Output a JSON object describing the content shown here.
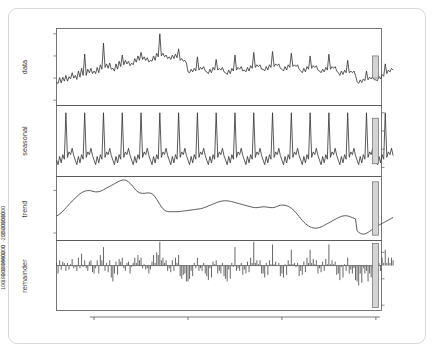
{
  "chart_data": {
    "type": "line",
    "title": "",
    "subtitle": "",
    "xlabel": "time",
    "ylabel": "",
    "grid": false,
    "legend": null,
    "x_ticks": [
      "1970",
      "1975",
      "1980",
      "1985"
    ],
    "x_tick_values": [
      1970,
      1975,
      1980,
      1985
    ],
    "xlim": [
      1968.0,
      1985.3
    ],
    "panels": [
      {
        "name": "data",
        "label": "data",
        "type": "line",
        "axis_side": "left",
        "ylim": [
          880,
          2620
        ],
        "y_ticks": [
          "1000",
          "1500",
          "2000",
          "2500"
        ],
        "y_tick_values": [
          1000,
          1500,
          2000,
          2500
        ],
        "bar_units": 500,
        "values": [
          1400,
          1380,
          1510,
          1390,
          1520,
          1430,
          1560,
          1430,
          1530,
          1480,
          1620,
          1500,
          1560,
          1470,
          1660,
          1520,
          1720,
          1560,
          2040,
          1560,
          1700,
          1620,
          1720,
          1600,
          1660,
          1600,
          1740,
          1620,
          1800,
          1700,
          2290,
          1740,
          1820,
          1720,
          1840,
          1700,
          1720,
          1660,
          1820,
          1700,
          1880,
          1760,
          2020,
          1800,
          1900,
          1820,
          1880,
          1780,
          1840,
          1800,
          1940,
          1860,
          2000,
          1900,
          2080,
          1920,
          1980,
          1900,
          1960,
          1860,
          1900,
          1880,
          2000,
          1900,
          2060,
          1980,
          2500,
          2000,
          2060,
          1980,
          2020,
          1940,
          1980,
          1920,
          2020,
          1940,
          2040,
          1960,
          2160,
          1900,
          1940,
          1880,
          1900,
          1840,
          1640,
          1620,
          1700,
          1640,
          1720,
          1660,
          1980,
          1680,
          1740,
          1700,
          1760,
          1660,
          1640,
          1600,
          1700,
          1620,
          1740,
          1680,
          1920,
          1680,
          1720,
          1680,
          1740,
          1640,
          1620,
          1580,
          1680,
          1600,
          1720,
          1660,
          2020,
          1680,
          1740,
          1700,
          1760,
          1660,
          1680,
          1640,
          1740,
          1660,
          1780,
          1720,
          2080,
          1740,
          1800,
          1760,
          1800,
          1700,
          1700,
          1660,
          1760,
          1680,
          1800,
          1740,
          2100,
          1760,
          1820,
          1780,
          1820,
          1720,
          1700,
          1660,
          1760,
          1680,
          1800,
          1740,
          2060,
          1760,
          1800,
          1760,
          1800,
          1700,
          1660,
          1620,
          1720,
          1640,
          1760,
          1700,
          2000,
          1720,
          1780,
          1740,
          1780,
          1680,
          1660,
          1620,
          1700,
          1640,
          1740,
          1680,
          2040,
          1700,
          1760,
          1720,
          1760,
          1660,
          1620,
          1560,
          1660,
          1580,
          1680,
          1620,
          1900,
          1620,
          1660,
          1620,
          1660,
          1560,
          1420,
          1380,
          1460,
          1400,
          1480,
          1440,
          1660,
          1460,
          1520,
          1480,
          1540,
          1460,
          1460,
          1440,
          1540,
          1480,
          1580,
          1540,
          1820,
          1600,
          1680,
          1640,
          1720,
          1680
        ]
      },
      {
        "name": "seasonal",
        "label": "seasonal",
        "type": "line",
        "axis_side": "right",
        "ylim": [
          -300,
          480
        ],
        "y_ticks": [
          "-200",
          "0",
          "200",
          "400"
        ],
        "y_tick_values": [
          -200,
          0,
          200,
          400
        ],
        "bar_units": 500,
        "pattern": [
          -120,
          -170,
          -80,
          -150,
          -60,
          -110,
          400,
          -90,
          -30,
          -60,
          10,
          -70
        ]
      },
      {
        "name": "trend",
        "label": "trend",
        "type": "line",
        "axis_side": "left",
        "ylim": [
          1330,
          1930
        ],
        "y_ticks": [
          "1400",
          "1800"
        ],
        "y_tick_values": [
          1400,
          1800
        ],
        "bar_units": 500,
        "values": [
          1560,
          1568,
          1578,
          1590,
          1604,
          1620,
          1636,
          1652,
          1668,
          1684,
          1700,
          1714,
          1728,
          1742,
          1756,
          1768,
          1778,
          1786,
          1792,
          1796,
          1798,
          1798,
          1796,
          1792,
          1788,
          1786,
          1786,
          1788,
          1792,
          1798,
          1806,
          1814,
          1822,
          1830,
          1838,
          1846,
          1854,
          1862,
          1870,
          1878,
          1886,
          1892,
          1896,
          1898,
          1896,
          1890,
          1880,
          1866,
          1850,
          1832,
          1814,
          1798,
          1786,
          1778,
          1774,
          1772,
          1772,
          1774,
          1776,
          1776,
          1774,
          1768,
          1756,
          1738,
          1716,
          1692,
          1668,
          1646,
          1628,
          1614,
          1606,
          1602,
          1600,
          1600,
          1600,
          1600,
          1600,
          1600,
          1600,
          1602,
          1604,
          1606,
          1608,
          1610,
          1612,
          1614,
          1616,
          1618,
          1620,
          1622,
          1624,
          1626,
          1628,
          1632,
          1636,
          1642,
          1648,
          1654,
          1660,
          1666,
          1672,
          1678,
          1684,
          1690,
          1694,
          1698,
          1700,
          1702,
          1702,
          1702,
          1700,
          1698,
          1694,
          1690,
          1686,
          1682,
          1678,
          1674,
          1670,
          1666,
          1662,
          1658,
          1654,
          1650,
          1646,
          1642,
          1640,
          1638,
          1638,
          1640,
          1642,
          1644,
          1646,
          1646,
          1644,
          1642,
          1640,
          1638,
          1638,
          1640,
          1644,
          1650,
          1656,
          1660,
          1662,
          1662,
          1660,
          1656,
          1650,
          1642,
          1632,
          1620,
          1606,
          1590,
          1572,
          1554,
          1536,
          1518,
          1502,
          1488,
          1476,
          1466,
          1458,
          1452,
          1448,
          1446,
          1446,
          1448,
          1452,
          1458,
          1464,
          1472,
          1480,
          1488,
          1496,
          1504,
          1512,
          1520,
          1528,
          1536,
          1544,
          1550,
          1556,
          1560,
          1562,
          1562,
          1560,
          1556,
          1550,
          1544,
          1538,
          1532,
          1420,
          1408,
          1398,
          1392,
          1390,
          1392,
          1398,
          1406,
          1416,
          1426,
          1436,
          1446,
          1456,
          1466,
          1474,
          1482,
          1490,
          1498,
          1506,
          1514,
          1522,
          1530,
          1538,
          1546
        ]
      },
      {
        "name": "remainder",
        "label": "remainder",
        "type": "bar",
        "axis_side": "right",
        "ylim": [
          -340,
          190
        ],
        "y_ticks": [
          "-300",
          "-100",
          "100"
        ],
        "y_tick_values": [
          -300,
          -100,
          100
        ],
        "bar_units": 500,
        "values": [
          20,
          -60,
          40,
          -30,
          30,
          20,
          -40,
          20,
          -30,
          10,
          50,
          -20,
          -10,
          -40,
          60,
          -20,
          90,
          -10,
          40,
          -20,
          -40,
          30,
          40,
          -50,
          -60,
          -20,
          40,
          -60,
          80,
          40,
          140,
          -40,
          20,
          -50,
          40,
          -90,
          -120,
          -60,
          30,
          -70,
          50,
          30,
          60,
          -20,
          -40,
          20,
          30,
          -60,
          -10,
          20,
          60,
          20,
          80,
          40,
          60,
          -20,
          10,
          -30,
          -20,
          -60,
          -30,
          30,
          80,
          20,
          100,
          80,
          180,
          40,
          60,
          20,
          40,
          -40,
          -20,
          -50,
          40,
          -40,
          60,
          20,
          80,
          -80,
          -100,
          -70,
          -60,
          -120,
          -120,
          -100,
          -40,
          -80,
          20,
          -20,
          60,
          -40,
          -20,
          -40,
          20,
          -60,
          -80,
          -110,
          -20,
          -90,
          30,
          10,
          40,
          -60,
          -40,
          -60,
          20,
          -80,
          -100,
          -120,
          -30,
          -100,
          20,
          -10,
          140,
          -40,
          -20,
          -40,
          20,
          -70,
          -30,
          -60,
          30,
          -50,
          60,
          20,
          180,
          20,
          40,
          10,
          40,
          -60,
          -60,
          -90,
          20,
          -70,
          40,
          10,
          160,
          10,
          30,
          0,
          20,
          -80,
          -60,
          -90,
          10,
          -70,
          40,
          10,
          120,
          10,
          20,
          -10,
          20,
          -80,
          -40,
          -70,
          30,
          -50,
          60,
          20,
          120,
          20,
          50,
          10,
          40,
          -60,
          -20,
          -50,
          30,
          -40,
          50,
          10,
          160,
          10,
          40,
          10,
          30,
          -70,
          -60,
          -110,
          -10,
          -90,
          10,
          -40,
          60,
          -60,
          -30,
          -60,
          -20,
          -110,
          -120,
          -150,
          -60,
          -130,
          -20,
          -60,
          -40,
          -120,
          -60,
          -90,
          -20,
          -110,
          -60,
          -70,
          20,
          -40,
          60,
          20,
          120,
          20,
          60,
          20,
          60,
          40
        ]
      }
    ]
  },
  "axis": {
    "x_title": "time"
  }
}
